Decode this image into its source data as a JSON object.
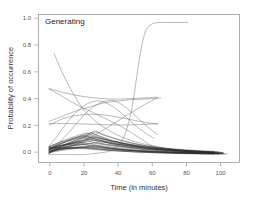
{
  "chart_data": {
    "type": "line",
    "title": "Generating",
    "xlabel": "Time (in minutes)",
    "ylabel": "Probability of occurrence",
    "xlim": [
      -6,
      112
    ],
    "ylim": [
      -0.06,
      1.06
    ],
    "xticks": [
      0,
      20,
      40,
      60,
      80,
      100
    ],
    "xticklabels": [
      "0",
      "20",
      "40",
      "60",
      "80",
      "100"
    ],
    "yticks": [
      0.0,
      0.2,
      0.4,
      0.6,
      0.8,
      1.0
    ],
    "yticklabels": [
      "0.0",
      "0.2",
      "0.4",
      "0.6",
      "0.8",
      "1.0"
    ],
    "grid": false,
    "legend": "none",
    "line_color": "#4a4a4a",
    "background_color": "#ffffff",
    "frame_color": "#9a9a9a",
    "series": [
      {
        "name": "sigmoid-saturating",
        "x": [
          0,
          10,
          20,
          28,
          34,
          38,
          42,
          45,
          48,
          50,
          52,
          54,
          56,
          58,
          62,
          70,
          82
        ],
        "values": [
          0.0,
          0.0,
          0.0,
          0.01,
          0.02,
          0.04,
          0.09,
          0.16,
          0.3,
          0.44,
          0.62,
          0.78,
          0.9,
          0.96,
          0.995,
          1.0,
          1.0
        ]
      },
      {
        "name": "steep-decay-from-high",
        "x": [
          3,
          8,
          14,
          20,
          26,
          32,
          40,
          50,
          60,
          72,
          85,
          100,
          104
        ],
        "values": [
          0.77,
          0.62,
          0.47,
          0.35,
          0.27,
          0.21,
          0.15,
          0.1,
          0.07,
          0.04,
          0.025,
          0.008,
          0.004
        ]
      },
      {
        "name": "rising-to-plateau-0p43",
        "x": [
          0,
          8,
          16,
          24,
          32,
          40,
          48,
          56,
          62,
          66
        ],
        "values": [
          0.25,
          0.29,
          0.33,
          0.36,
          0.39,
          0.405,
          0.415,
          0.42,
          0.425,
          0.43
        ]
      },
      {
        "name": "slow-decline-from-0p50",
        "x": [
          0,
          10,
          20,
          30,
          40,
          50,
          58,
          64
        ],
        "values": [
          0.5,
          0.465,
          0.44,
          0.425,
          0.42,
          0.425,
          0.43,
          0.435
        ]
      },
      {
        "name": "broad-hump-peak-0p41",
        "x": [
          0,
          6,
          12,
          18,
          24,
          30,
          36,
          40,
          46,
          52,
          58,
          64
        ],
        "values": [
          0.03,
          0.09,
          0.17,
          0.26,
          0.34,
          0.39,
          0.41,
          0.4,
          0.35,
          0.28,
          0.21,
          0.15
        ]
      },
      {
        "name": "hump-peak-0p40-early",
        "x": [
          0,
          5,
          10,
          16,
          22,
          28,
          32,
          38,
          44,
          50,
          56,
          62
        ],
        "values": [
          0.06,
          0.14,
          0.23,
          0.32,
          0.38,
          0.405,
          0.4,
          0.36,
          0.3,
          0.23,
          0.17,
          0.12
        ]
      },
      {
        "name": "mid-plateau-0p30",
        "x": [
          0,
          8,
          16,
          24,
          32,
          40,
          48,
          56,
          64
        ],
        "values": [
          0.22,
          0.27,
          0.295,
          0.305,
          0.3,
          0.285,
          0.265,
          0.245,
          0.23
        ]
      },
      {
        "name": "rising-late-to-0p43",
        "x": [
          0,
          10,
          20,
          30,
          40,
          50,
          58,
          64
        ],
        "values": [
          0.02,
          0.05,
          0.1,
          0.17,
          0.25,
          0.33,
          0.39,
          0.43
        ]
      },
      {
        "name": "descend-cross-to-low",
        "x": [
          0,
          8,
          16,
          24,
          32,
          40,
          48,
          54,
          60,
          64
        ],
        "values": [
          0.5,
          0.44,
          0.38,
          0.33,
          0.28,
          0.23,
          0.17,
          0.12,
          0.07,
          0.04
        ]
      },
      {
        "name": "flat-0p23-band",
        "x": [
          0,
          12,
          24,
          36,
          48,
          58,
          64
        ],
        "values": [
          0.235,
          0.235,
          0.23,
          0.225,
          0.225,
          0.23,
          0.235
        ]
      },
      {
        "name": "dense-bundle",
        "count": 28,
        "peak_x_range": [
          18,
          27
        ],
        "peak_y_range": [
          0.04,
          0.185
        ],
        "start_y_range": [
          0.005,
          0.06
        ],
        "end_x_range": [
          95,
          106
        ],
        "end_y": 0.005
      }
    ]
  }
}
